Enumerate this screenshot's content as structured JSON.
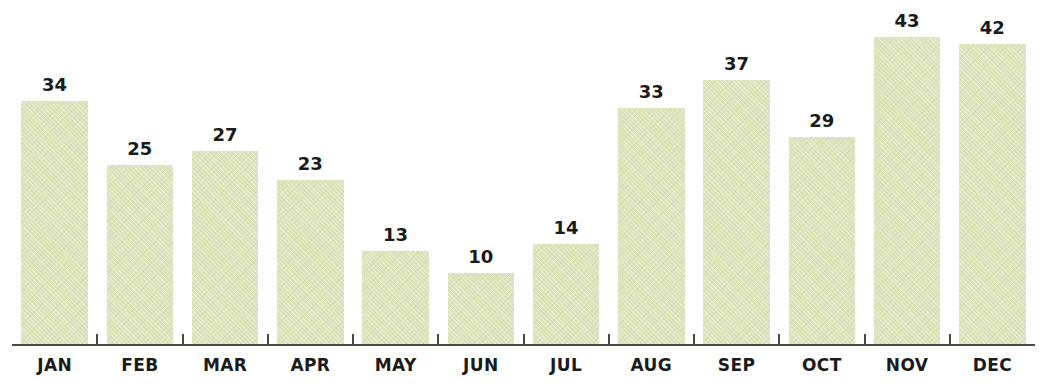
{
  "chart_data": {
    "type": "bar",
    "title": "",
    "subtitle": "",
    "xlabel": "",
    "ylabel": "",
    "categories": [
      "JAN",
      "FEB",
      "MAR",
      "APR",
      "MAY",
      "JUN",
      "JUL",
      "AUG",
      "SEP",
      "OCT",
      "NOV",
      "DEC"
    ],
    "values": [
      34,
      25,
      27,
      23,
      13,
      10,
      14,
      33,
      37,
      29,
      43,
      42
    ],
    "value_labels": [
      "34",
      "25",
      "27",
      "23",
      "13",
      "10",
      "14",
      "33",
      "37",
      "29",
      "43",
      "42"
    ],
    "ylim": [
      0,
      47
    ],
    "grid": false,
    "legend": null,
    "legend_position": "none",
    "bar_color": "#dde3ba",
    "axis_color": "#4a4a42",
    "label_color": "#1b1b1b",
    "background_color": "#ffffff",
    "annotations": "Each bar is labeled with its value above the bar; tick marks separate adjacent month categories along the baseline."
  }
}
